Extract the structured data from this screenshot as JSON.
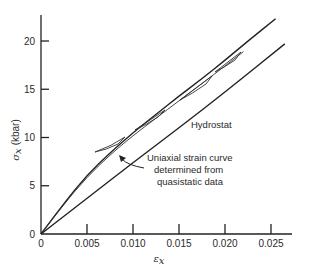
{
  "chart_data": {
    "type": "line",
    "title": "",
    "xlabel": "εx",
    "ylabel": "σx (kbar)",
    "xlim": [
      0,
      0.028
    ],
    "ylim": [
      0,
      23
    ],
    "grid": false,
    "legend": null,
    "x_ticks": [
      "0",
      "0.005",
      "0.010",
      "0.015",
      "0.020",
      "0.025"
    ],
    "y_ticks": [
      "0",
      "5",
      "10",
      "15",
      "20"
    ],
    "series": [
      {
        "name": "Upper loading curve",
        "x": [
          0,
          0.0025,
          0.005,
          0.0075,
          0.01,
          0.0125,
          0.015,
          0.0175,
          0.02,
          0.0225,
          0.0255
        ],
        "y": [
          0,
          3.2,
          6.1,
          8.4,
          10.5,
          12.4,
          14.3,
          16.1,
          18.0,
          20.0,
          22.3
        ]
      },
      {
        "name": "Uniaxial strain curve determined from quasistatic data",
        "x": [
          0,
          0.0025,
          0.005,
          0.0075,
          0.01,
          0.0125,
          0.015,
          0.0175,
          0.02,
          0.022
        ],
        "y": [
          0,
          3.1,
          5.9,
          8.2,
          10.2,
          12.0,
          13.8,
          15.6,
          17.4,
          18.9
        ]
      },
      {
        "name": "Hydrostat",
        "x": [
          0,
          0.005,
          0.01,
          0.015,
          0.02,
          0.0265
        ],
        "y": [
          0,
          3.7,
          7.4,
          11.0,
          14.7,
          19.7
        ]
      }
    ],
    "annotations": [
      {
        "text": "Hydrostat",
        "x": 0.0165,
        "y": 11.3
      },
      {
        "text": "Uniaxial strain curve",
        "x": 0.0115,
        "y": 8.0
      },
      {
        "text": "determined from",
        "x": 0.0115,
        "y": 6.7
      },
      {
        "text": "quasistatic data",
        "x": 0.0115,
        "y": 5.4
      }
    ]
  },
  "labels": {
    "ylabel_symbol": "σ",
    "ylabel_sub": "x",
    "ylabel_unit": "(kbar)",
    "xlabel_symbol": "ε",
    "xlabel_sub": "x",
    "hydrostat": "Hydrostat",
    "annot_line1": "Uniaxial strain curve",
    "annot_line2": "determined from",
    "annot_line3": "quasistatic data"
  }
}
